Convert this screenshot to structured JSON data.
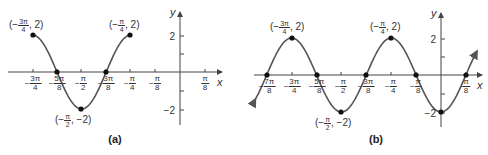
{
  "colors": {
    "curve": "#555555",
    "axis": "#444444",
    "point": "#111111",
    "text": "#333333"
  },
  "chart_data": [
    {
      "type": "line",
      "panel": "(a)",
      "title": "(a)",
      "xlabel": "x",
      "ylabel": "y",
      "function": "y = 2cos(4x + 3π)  on [−3π/4, −π/4]",
      "x_ticks": [
        "−3π/4",
        "−5π/8",
        "−π/2",
        "−3π/8",
        "−π/4",
        "−π/8",
        "π/8"
      ],
      "y_ticks": [
        "2",
        "−2"
      ],
      "ylim": [
        -2.5,
        2.5
      ],
      "points": [
        {
          "x": "−3π/4",
          "y": 2,
          "label": "(−3π/4, 2)"
        },
        {
          "x": "−5π/8",
          "y": 0
        },
        {
          "x": "−π/2",
          "y": -2,
          "label": "(−π/2, −2)"
        },
        {
          "x": "−3π/8",
          "y": 0
        },
        {
          "x": "−π/4",
          "y": 2,
          "label": "(−π/4, 2)"
        }
      ]
    },
    {
      "type": "line",
      "panel": "(b)",
      "title": "(b)",
      "xlabel": "x",
      "ylabel": "y",
      "function": "y = −2cos(4x)  extended with arrows",
      "x_ticks": [
        "−7π/8",
        "−3π/4",
        "−5π/8",
        "−π/2",
        "−3π/8",
        "−π/4",
        "−π/8",
        "π/8"
      ],
      "y_ticks": [
        "2",
        "−2"
      ],
      "ylim": [
        -2.5,
        2.5
      ],
      "points": [
        {
          "x": "−7π/8",
          "y": 0
        },
        {
          "x": "−3π/4",
          "y": 2,
          "label": "(−3π/4, 2)"
        },
        {
          "x": "−5π/8",
          "y": 0
        },
        {
          "x": "−π/2",
          "y": -2,
          "label": "(−π/2, −2)"
        },
        {
          "x": "−3π/8",
          "y": 0
        },
        {
          "x": "−π/4",
          "y": 2,
          "label": "(−π/4, 2)"
        },
        {
          "x": "−π/8",
          "y": 0
        },
        {
          "x": "0",
          "y": -2
        },
        {
          "x": "π/8",
          "y": 0
        }
      ]
    }
  ],
  "panels": {
    "a": {
      "caption": "(a)",
      "x_axis": "x",
      "y_axis": "y",
      "y_tick_2": "2",
      "y_tick_neg2": "−2",
      "ticks": [
        {
          "neg": "−",
          "num": "3π",
          "den": "4"
        },
        {
          "neg": "−",
          "num": "5π",
          "den": "8"
        },
        {
          "neg": "−",
          "num": "π",
          "den": "2"
        },
        {
          "neg": "−",
          "num": "3π",
          "den": "8"
        },
        {
          "neg": "−",
          "num": "π",
          "den": "4"
        },
        {
          "neg": "−",
          "num": "π",
          "den": "8"
        },
        {
          "neg": "",
          "num": "π",
          "den": "8"
        }
      ],
      "annotations": [
        {
          "pre": "(−",
          "num": "3π",
          "den": "4",
          "post": ", 2)"
        },
        {
          "pre": "(−",
          "num": "π",
          "den": "4",
          "post": ", 2)"
        },
        {
          "pre": "(−",
          "num": "π",
          "den": "2",
          "post": ", −2)"
        }
      ]
    },
    "b": {
      "caption": "(b)",
      "x_axis": "x",
      "y_axis": "y",
      "y_tick_2": "2",
      "y_tick_neg2": "−2",
      "ticks": [
        {
          "neg": "−",
          "num": "7π",
          "den": "8"
        },
        {
          "neg": "−",
          "num": "3π",
          "den": "4"
        },
        {
          "neg": "−",
          "num": "5π",
          "den": "8"
        },
        {
          "neg": "−",
          "num": "π",
          "den": "2"
        },
        {
          "neg": "−",
          "num": "3π",
          "den": "8"
        },
        {
          "neg": "−",
          "num": "π",
          "den": "4"
        },
        {
          "neg": "−",
          "num": "π",
          "den": "8"
        },
        {
          "neg": "",
          "num": "π",
          "den": "8"
        }
      ],
      "annotations": [
        {
          "pre": "(−",
          "num": "3π",
          "den": "4",
          "post": ", 2)"
        },
        {
          "pre": "(−",
          "num": "π",
          "den": "4",
          "post": ", 2)"
        },
        {
          "pre": "(−",
          "num": "π",
          "den": "2",
          "post": ", −2)"
        }
      ]
    }
  }
}
